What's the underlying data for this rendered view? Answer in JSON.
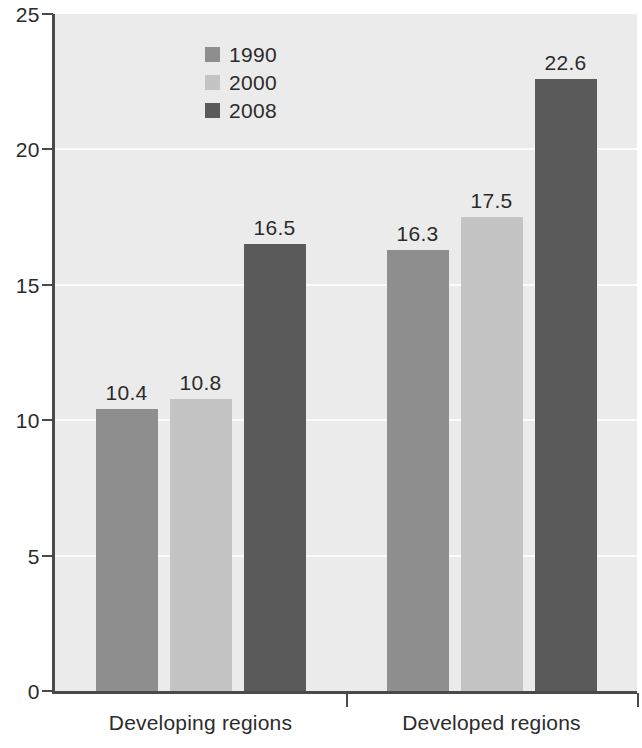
{
  "chart_data": {
    "type": "bar",
    "title": "",
    "subtitle": "",
    "xlabel": "",
    "ylabel": "",
    "categories": [
      "Developing regions",
      "Developed regions"
    ],
    "series": [
      {
        "name": "1990",
        "values": [
          10.4,
          10.8
        ],
        "color": "#8e8e8e"
      },
      {
        "name": "2000",
        "values": [
          10.8,
          17.5
        ],
        "color": "#c4c4c4"
      },
      {
        "name": "2008",
        "values": [
          16.5,
          22.6
        ],
        "color": "#5a5a5a"
      }
    ],
    "bars": [
      {
        "group": "Developing regions",
        "series": "1990",
        "value": 10.4,
        "label": "10.4",
        "color": "#8e8e8e"
      },
      {
        "group": "Developing regions",
        "series": "2000",
        "value": 10.8,
        "label": "10.8",
        "color": "#c4c4c4"
      },
      {
        "group": "Developing regions",
        "series": "2008",
        "value": 16.5,
        "label": "16.5",
        "color": "#5a5a5a"
      },
      {
        "group": "Developed regions",
        "series": "1990",
        "value": 16.3,
        "label": "16.3",
        "color": "#8e8e8e"
      },
      {
        "group": "Developed regions",
        "series": "2000",
        "value": 17.5,
        "label": "17.5",
        "color": "#c4c4c4"
      },
      {
        "group": "Developed regions",
        "series": "2008",
        "value": 22.6,
        "label": "22.6",
        "color": "#5a5a5a"
      }
    ],
    "ylim": [
      0,
      25
    ],
    "yticks": [
      0,
      5,
      10,
      15,
      20,
      25
    ],
    "ytick_labels": [
      "0",
      "5",
      "10",
      "15",
      "20",
      "25"
    ],
    "grid": true,
    "grid_color": "#fbfbfb",
    "plot_background": "#ebebeb",
    "axis_color": "#4a4a4a",
    "legend_position": "top-left-inside"
  },
  "legend": {
    "entries": [
      {
        "label": "1990",
        "color": "#8e8e8e"
      },
      {
        "label": "2000",
        "color": "#c4c4c4"
      },
      {
        "label": "2008",
        "color": "#5a5a5a"
      }
    ]
  },
  "axis": {
    "y_labels": [
      "25",
      "20",
      "15",
      "10",
      "5",
      "0"
    ]
  },
  "categories": [
    {
      "label": "Developing regions"
    },
    {
      "label": "Developed regions"
    }
  ]
}
